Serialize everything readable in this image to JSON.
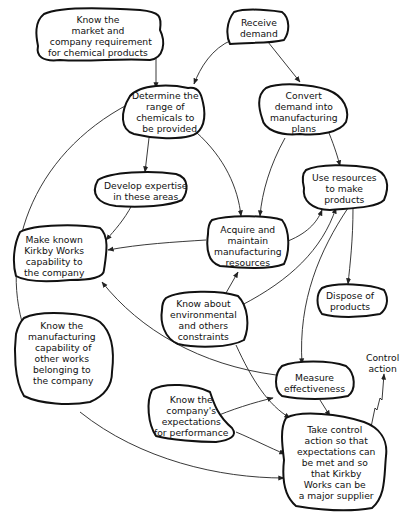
{
  "diagram": {
    "type": "influence / activity diagram",
    "nodes": [
      {
        "id": "know-market",
        "text": "Know the\nmarket and\n  company requirement\nfor chemical products"
      },
      {
        "id": "receive-demand",
        "text": "Receive\ndemand"
      },
      {
        "id": "determine-range",
        "text": "Determine the\nrange of\nchemicals to\n   be provided"
      },
      {
        "id": "convert-demand",
        "text": "Convert\ndemand into\nmanufacturing\nplans"
      },
      {
        "id": "develop-expertise",
        "text": "Develop expertise\nin these areas"
      },
      {
        "id": "use-resources",
        "text": "Use resources\nto make\nproducts"
      },
      {
        "id": "make-known",
        "text": "Make known\nKirkby Works\ncapability to\nthe company"
      },
      {
        "id": "acquire-maintain",
        "text": "Acquire and\nmaintain\nmanufacturing\nresources"
      },
      {
        "id": "know-environmental",
        "text": "Know about\nenvironmental\nand others\nconstraints"
      },
      {
        "id": "dispose-products",
        "text": "Dispose of\nproducts"
      },
      {
        "id": "know-capability",
        "text": "Know the\nmanufacturing\n capability of\nother works\nbelonging to\n the company"
      },
      {
        "id": "measure-effectiveness",
        "text": "Measure\neffectiveness"
      },
      {
        "id": "know-expectations",
        "text": "Know the\ncompany's\nexpectations\nfor performance"
      },
      {
        "id": "take-control",
        "text": "Take control\n action so that\n expectations can\nbe met and so\n that Kirkby\nWorks can be\n a major supplier"
      }
    ],
    "edges": [
      {
        "from": "know-market",
        "to": "determine-range"
      },
      {
        "from": "receive-demand",
        "to": "determine-range"
      },
      {
        "from": "receive-demand",
        "to": "convert-demand"
      },
      {
        "from": "determine-range",
        "to": "develop-expertise"
      },
      {
        "from": "determine-range",
        "to": "acquire-maintain"
      },
      {
        "from": "convert-demand",
        "to": "acquire-maintain"
      },
      {
        "from": "convert-demand",
        "to": "use-resources"
      },
      {
        "from": "develop-expertise",
        "to": "make-known"
      },
      {
        "from": "acquire-maintain",
        "to": "make-known"
      },
      {
        "from": "acquire-maintain",
        "to": "use-resources"
      },
      {
        "from": "know-environmental",
        "to": "acquire-maintain"
      },
      {
        "from": "know-environmental",
        "to": "use-resources"
      },
      {
        "from": "know-environmental",
        "to": "take-control"
      },
      {
        "from": "use-resources",
        "to": "dispose-products"
      },
      {
        "from": "use-resources",
        "to": "measure-effectiveness"
      },
      {
        "from": "measure-effectiveness",
        "to": "make-known"
      },
      {
        "from": "measure-effectiveness",
        "to": "take-control"
      },
      {
        "from": "know-capability",
        "to": "determine-range"
      },
      {
        "from": "know-capability",
        "to": "take-control"
      },
      {
        "from": "know-expectations",
        "to": "measure-effectiveness"
      },
      {
        "from": "know-expectations",
        "to": "take-control"
      },
      {
        "from": "take-control",
        "to": "control-action"
      }
    ],
    "free_labels": {
      "control_action": "Control\naction"
    },
    "colors": {
      "ink": "#111111",
      "background": "#ffffff"
    }
  }
}
